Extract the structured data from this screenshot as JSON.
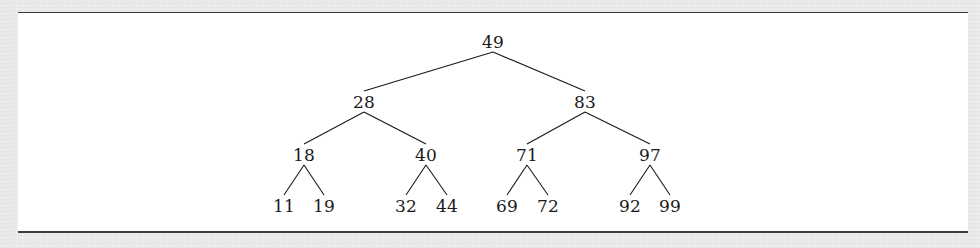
{
  "figure": {
    "kind": "binary-search-tree-diagram",
    "background_color": "#ffffff",
    "page_background_color": "#ececec",
    "rule_color": "#3c3c3c",
    "text_color": "#1a1a1a",
    "edge_color": "#1a1a1a"
  },
  "tree": {
    "root": "49",
    "levels": [
      {
        "level": 0,
        "values": [
          "49"
        ]
      },
      {
        "level": 1,
        "values": [
          "28",
          "83"
        ]
      },
      {
        "level": 2,
        "values": [
          "18",
          "40",
          "71",
          "97"
        ]
      },
      {
        "level": 3,
        "values": [
          "11",
          "19",
          "32",
          "44",
          "69",
          "72",
          "92",
          "99"
        ]
      }
    ],
    "nodes": [
      {
        "id": "n49",
        "label": "49",
        "x": 493,
        "y": 42,
        "level": 0
      },
      {
        "id": "n28",
        "label": "28",
        "x": 364,
        "y": 102,
        "level": 1
      },
      {
        "id": "n83",
        "label": "83",
        "x": 585,
        "y": 102,
        "level": 1
      },
      {
        "id": "n18",
        "label": "18",
        "x": 304,
        "y": 155,
        "level": 2
      },
      {
        "id": "n40",
        "label": "40",
        "x": 426,
        "y": 155,
        "level": 2
      },
      {
        "id": "n71",
        "label": "71",
        "x": 527,
        "y": 155,
        "level": 2
      },
      {
        "id": "n97",
        "label": "97",
        "x": 650,
        "y": 155,
        "level": 2
      },
      {
        "id": "n11",
        "label": "11",
        "x": 284,
        "y": 206,
        "level": 3
      },
      {
        "id": "n19",
        "label": "19",
        "x": 324,
        "y": 206,
        "level": 3
      },
      {
        "id": "n32",
        "label": "32",
        "x": 406,
        "y": 206,
        "level": 3
      },
      {
        "id": "n44",
        "label": "44",
        "x": 447,
        "y": 206,
        "level": 3
      },
      {
        "id": "n69",
        "label": "69",
        "x": 507,
        "y": 206,
        "level": 3
      },
      {
        "id": "n72",
        "label": "72",
        "x": 548,
        "y": 206,
        "level": 3
      },
      {
        "id": "n92",
        "label": "92",
        "x": 630,
        "y": 206,
        "level": 3
      },
      {
        "id": "n99",
        "label": "99",
        "x": 670,
        "y": 206,
        "level": 3
      }
    ],
    "edges": [
      {
        "from": "n49",
        "to": "n28"
      },
      {
        "from": "n49",
        "to": "n83"
      },
      {
        "from": "n28",
        "to": "n18"
      },
      {
        "from": "n28",
        "to": "n40"
      },
      {
        "from": "n83",
        "to": "n71"
      },
      {
        "from": "n83",
        "to": "n97"
      },
      {
        "from": "n18",
        "to": "n11"
      },
      {
        "from": "n18",
        "to": "n19"
      },
      {
        "from": "n40",
        "to": "n32"
      },
      {
        "from": "n40",
        "to": "n44"
      },
      {
        "from": "n71",
        "to": "n69"
      },
      {
        "from": "n71",
        "to": "n72"
      },
      {
        "from": "n97",
        "to": "n92"
      },
      {
        "from": "n97",
        "to": "n99"
      }
    ]
  }
}
